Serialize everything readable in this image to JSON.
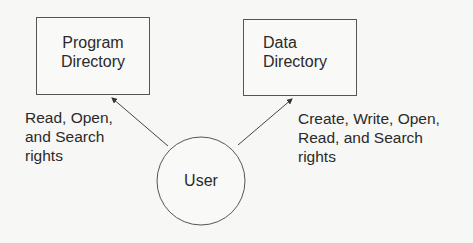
{
  "diagram": {
    "nodes": {
      "program_directory": {
        "line1": "Program",
        "line2": "Directory"
      },
      "data_directory": {
        "line1": "Data",
        "line2": "Directory"
      },
      "user": {
        "label": "User"
      }
    },
    "edges": {
      "user_to_program": {
        "from": "User",
        "to": "Program Directory",
        "label_lines": [
          "Read, Open,",
          "and Search",
          "rights"
        ]
      },
      "user_to_data": {
        "from": "User",
        "to": "Data Directory",
        "label_lines": [
          "Create, Write, Open,",
          "Read, and Search",
          "rights"
        ]
      }
    }
  }
}
